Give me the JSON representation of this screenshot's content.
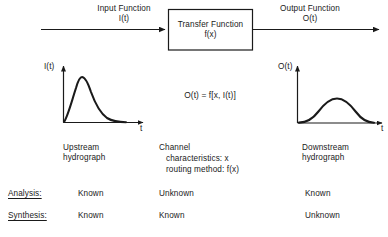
{
  "diagram": {
    "title_block": {
      "input_label_line1": "Input Function",
      "input_label_line2": "I(t)",
      "transfer_label_line1": "Transfer Function",
      "transfer_label_line2": "f(x)",
      "output_label_line1": "Output Function",
      "output_label_line2": "O(t)"
    },
    "equation": "O(t) = f[x, I(t)]",
    "left_plot": {
      "y_axis_label": "I(t)",
      "x_axis_label": "t",
      "caption_line1": "Upstream",
      "caption_line2": "hydrograph",
      "curve_type": "sharp-peaked-hydrograph"
    },
    "right_plot": {
      "y_axis_label": "O(t)",
      "x_axis_label": "t",
      "caption_line1": "Downstream",
      "caption_line2": "hydrograph",
      "curve_type": "broad-attenuated-hydrograph"
    },
    "middle_caption": {
      "line1": "Channel",
      "line2": "characteristics:  x",
      "line3": "routing method:  f(x)"
    },
    "table": {
      "rows": [
        {
          "label": "Analysis:",
          "col1": "Known",
          "col2": "Unknown",
          "col3": "Known"
        },
        {
          "label": "Synthesis:",
          "col1": "Known",
          "col2": "Known",
          "col3": "Unknown"
        }
      ]
    },
    "colors": {
      "ink": "#1a1a1a",
      "background": "#ffffff",
      "faded_caption": "#a8a8a8"
    }
  }
}
